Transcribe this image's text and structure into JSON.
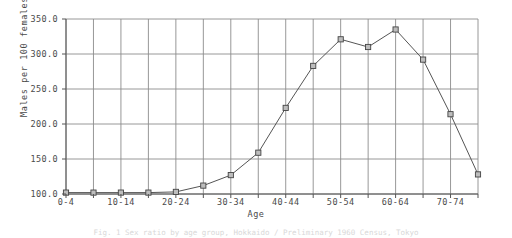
{
  "chart_data": {
    "type": "line",
    "title": "",
    "xlabel": "Age",
    "ylabel": "Males per 100 females",
    "categories": [
      "0-4",
      "5-9",
      "10-14",
      "15-19",
      "20-24",
      "25-29",
      "30-34",
      "35-39",
      "40-44",
      "45-49",
      "50-54",
      "55-59",
      "60-64",
      "65-69",
      "70-74",
      "75+"
    ],
    "values": [
      102,
      102,
      102,
      102,
      103,
      112,
      127,
      159,
      223,
      283,
      321,
      310,
      335,
      292,
      214,
      128
    ],
    "x_tick_labels": [
      "0-4",
      "10-14",
      "20-24",
      "30-34",
      "40-44",
      "50-54",
      "60-64",
      "70-74"
    ],
    "y_tick_labels": [
      "350.0",
      "300.0",
      "250.0",
      "200.0",
      "150.0",
      "100.0"
    ],
    "y_ticks": [
      350,
      300,
      250,
      200,
      150,
      100
    ],
    "ylim": [
      100,
      350
    ],
    "grid": true,
    "legend": "none",
    "marker": "square",
    "line_color": "#555555",
    "grid_color": "#8c8c8c",
    "marker_fill": "#bdbdbd"
  },
  "caption": {
    "text": "Fig. 1  Sex ratio by age group, Hokkaido / Preliminary 1960 Census, Tokyo"
  }
}
